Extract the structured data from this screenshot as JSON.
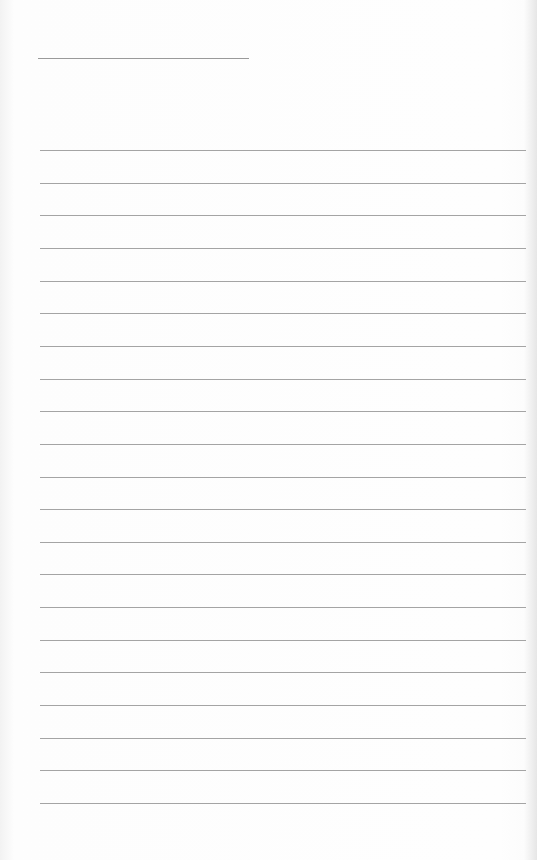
{
  "page": {
    "type": "blank lined paper",
    "background": "#fefefe",
    "line_color": "#a4a4a4"
  },
  "title_line": {
    "x": 38,
    "y": 58,
    "width": 211
  },
  "rules": {
    "count": 21,
    "first_y": 150,
    "spacing": 32.65,
    "x": 40,
    "width": 486
  }
}
